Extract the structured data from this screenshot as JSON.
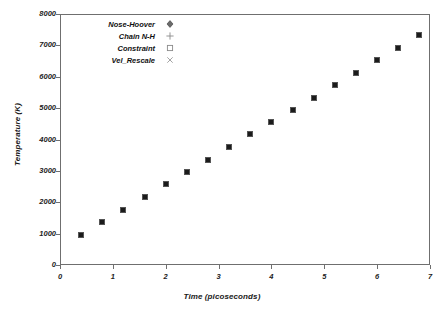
{
  "chart_data": {
    "type": "scatter",
    "title": "",
    "xlabel": "Time (picoseconds)",
    "ylabel": "Temperature (K)",
    "xlim": [
      0,
      7
    ],
    "ylim": [
      0,
      8000
    ],
    "xticks": [
      "0",
      "1",
      "2",
      "3",
      "4",
      "5",
      "6",
      "7"
    ],
    "xtick_values": [
      0,
      1,
      2,
      3,
      4,
      5,
      6,
      7
    ],
    "yticks": [
      "0",
      "1000",
      "2000",
      "3000",
      "4000",
      "5000",
      "6000",
      "7000",
      "8000"
    ],
    "ytick_values": [
      0,
      1000,
      2000,
      3000,
      4000,
      5000,
      6000,
      7000,
      8000
    ],
    "grid": false,
    "legend_position": "top-left",
    "series": [
      {
        "name": "Nose-Hoover",
        "marker": "diamond",
        "x": [
          0.4,
          0.8,
          1.2,
          1.6,
          2.0,
          2.4,
          2.8,
          3.2,
          3.6,
          4.0,
          4.4,
          4.8,
          5.2,
          5.6,
          6.0,
          6.4,
          6.8
        ],
        "values": [
          950,
          1370,
          1760,
          2170,
          2570,
          2970,
          3360,
          3760,
          4160,
          4550,
          4930,
          5330,
          5740,
          6130,
          6530,
          6930,
          7320
        ]
      },
      {
        "name": "Chain N-H",
        "marker": "plus",
        "x": [],
        "values": []
      },
      {
        "name": "Constraint",
        "marker": "square-open",
        "x": [],
        "values": []
      },
      {
        "name": "Vel_Rescale",
        "marker": "cross",
        "x": [],
        "values": []
      }
    ]
  },
  "legend": {
    "entries": [
      {
        "label": "Nose-Hoover",
        "marker": "diamond-marker-icon"
      },
      {
        "label": "Chain N-H",
        "marker": "plus-marker-icon"
      },
      {
        "label": "Constraint",
        "marker": "square-marker-icon"
      },
      {
        "label": "Vel_Rescale",
        "marker": "cross-marker-icon"
      }
    ]
  },
  "colors": {
    "marker": "#1b1b1b",
    "axis": "#6f6f6f",
    "text": "#1a1a1a",
    "background": "#ffffff"
  }
}
